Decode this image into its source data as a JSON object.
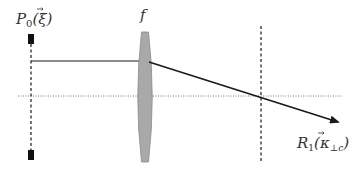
{
  "diagram": {
    "labels": {
      "source_plane": "P",
      "source_plane_sub": "0",
      "source_plane_arg": "(ξ)",
      "lens": "f",
      "detector": "R",
      "detector_sub": "1",
      "detector_arg_open": "(",
      "detector_arg_kappa": "κ",
      "detector_arg_sub": "⊥c",
      "detector_arg_close": ")"
    },
    "elements": [
      {
        "id": "source-plane",
        "type": "dashed-vertical-line",
        "x": 31
      },
      {
        "id": "lens",
        "type": "biconvex-lens",
        "x": 145,
        "color": "#a9a9a9"
      },
      {
        "id": "focal-plane",
        "type": "dashed-vertical-line",
        "x": 261
      },
      {
        "id": "optical-axis",
        "type": "dotted-horizontal-line",
        "y": 96
      },
      {
        "id": "ray",
        "type": "arrow",
        "from": [
          31,
          61
        ],
        "via": [
          148,
          61
        ],
        "to": [
          340,
          123
        ]
      }
    ],
    "colors": {
      "line": "#1a1a1a",
      "lens_fill": "#a9a9a9",
      "lens_stroke": "#8a8a8a",
      "axis": "#7a7a7a",
      "text": "#333333"
    }
  }
}
